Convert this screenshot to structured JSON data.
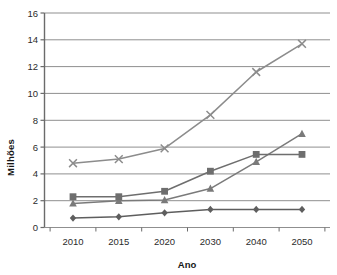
{
  "chart_data": {
    "type": "line",
    "title": "",
    "xlabel": "Ano",
    "ylabel": "Milhões",
    "x": [
      2010,
      2015,
      2020,
      2030,
      2040,
      2050
    ],
    "categories": [
      "2010",
      "2015",
      "2020",
      "2030",
      "2040",
      "2050"
    ],
    "xtick_labels": [
      "2010",
      "2015",
      "2020",
      "2030",
      "2040",
      "2050"
    ],
    "ytick_labels": [
      "0",
      "2",
      "4",
      "6",
      "8",
      "10",
      "12",
      "14",
      "16"
    ],
    "yticks": [
      0,
      2,
      4,
      6,
      8,
      10,
      12,
      14,
      16
    ],
    "ylim": [
      0,
      16
    ],
    "grid": "horizontal",
    "legend": "none",
    "series": [
      {
        "name": "serie-x-cross",
        "marker": "x",
        "color": "#8c8c8c",
        "values": [
          4.8,
          5.1,
          5.9,
          8.4,
          11.6,
          13.7
        ]
      },
      {
        "name": "serie-triangle",
        "marker": "triangle",
        "color": "#7a7a7a",
        "values": [
          1.8,
          2.0,
          2.05,
          2.9,
          4.9,
          7.0
        ]
      },
      {
        "name": "serie-square",
        "marker": "square",
        "color": "#6e6e6e",
        "values": [
          2.3,
          2.3,
          2.7,
          4.2,
          5.45,
          5.45
        ]
      },
      {
        "name": "serie-diamond",
        "marker": "diamond",
        "color": "#5e5e5e",
        "values": [
          0.7,
          0.8,
          1.1,
          1.35,
          1.35,
          1.35
        ]
      }
    ],
    "colors": {
      "grid": "#8f8f8f",
      "axis": "#6b6b6b",
      "text": "#2b2b2b",
      "background": "#ffffff"
    }
  }
}
